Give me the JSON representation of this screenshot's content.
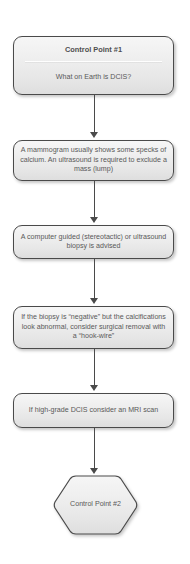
{
  "diagram": {
    "background_color": "#ffffff",
    "node_fill_top": "#f6f6f6",
    "node_fill_bottom": "#dedede",
    "node_border_color": "#4a4a4a",
    "text_color": "#595959"
  },
  "nodes": [
    {
      "id": "control-point-1",
      "shape": "rounded-rectangle",
      "title": "Control Point #1",
      "text": "What on Earth is DCIS?"
    },
    {
      "id": "mammogram-step",
      "shape": "rounded-rectangle",
      "text": "A mammogram usually shows some specks of calcium. An ultrasound is required to exclude a mass (lump)"
    },
    {
      "id": "biopsy-step",
      "shape": "rounded-rectangle",
      "text": "A computer guided (stereotactic) or ultrasound biopsy is advised"
    },
    {
      "id": "negative-biopsy-step",
      "shape": "rounded-rectangle",
      "text": "If the biopsy is “negative” but the calcifications look abnormal, consider surgical removal with a “hook-wire”"
    },
    {
      "id": "mri-step",
      "shape": "rounded-rectangle",
      "text": "If high-grade DCIS consider an MRI scan"
    },
    {
      "id": "control-point-2",
      "shape": "hexagon",
      "text": "Control Point #2"
    }
  ],
  "connectors": [
    {
      "id": "connector-1",
      "from": "control-point-1",
      "to": "mammogram-step",
      "arrow": "down"
    },
    {
      "id": "connector-2",
      "from": "mammogram-step",
      "to": "biopsy-step",
      "arrow": "down"
    },
    {
      "id": "connector-3",
      "from": "biopsy-step",
      "to": "negative-biopsy-step",
      "arrow": "down"
    },
    {
      "id": "connector-4",
      "from": "negative-biopsy-step",
      "to": "mri-step",
      "arrow": "down"
    },
    {
      "id": "connector-5",
      "from": "mri-step",
      "to": "control-point-2",
      "arrow": "down"
    }
  ]
}
